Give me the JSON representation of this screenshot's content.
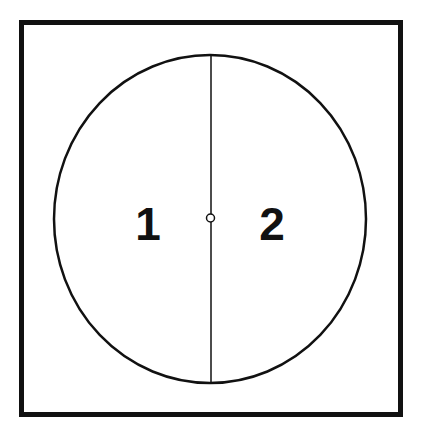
{
  "diagram": {
    "regions": [
      {
        "id": "region-1",
        "label": "1"
      },
      {
        "id": "region-2",
        "label": "2"
      }
    ],
    "colors": {
      "stroke": "#111111",
      "background": "#ffffff"
    }
  }
}
